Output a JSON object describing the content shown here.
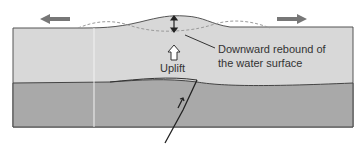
{
  "diagram": {
    "labels": {
      "uplift": "Uplift",
      "rebound_line1": "Downward rebound of",
      "rebound_line2": "the water surface"
    },
    "icons": {
      "left_arrow": "arrow-left-icon",
      "right_arrow": "arrow-right-icon",
      "uplift_arrow": "arrow-up-outline-icon",
      "double_arrow": "double-arrow-vertical-icon",
      "fault_motion": "fault-slip-arrow-icon"
    },
    "colors": {
      "water": "#d8d8d8",
      "crust": "#a9a9a9",
      "outline": "#444444",
      "arrow": "#777777",
      "dashed": "#9a9a9a"
    }
  }
}
